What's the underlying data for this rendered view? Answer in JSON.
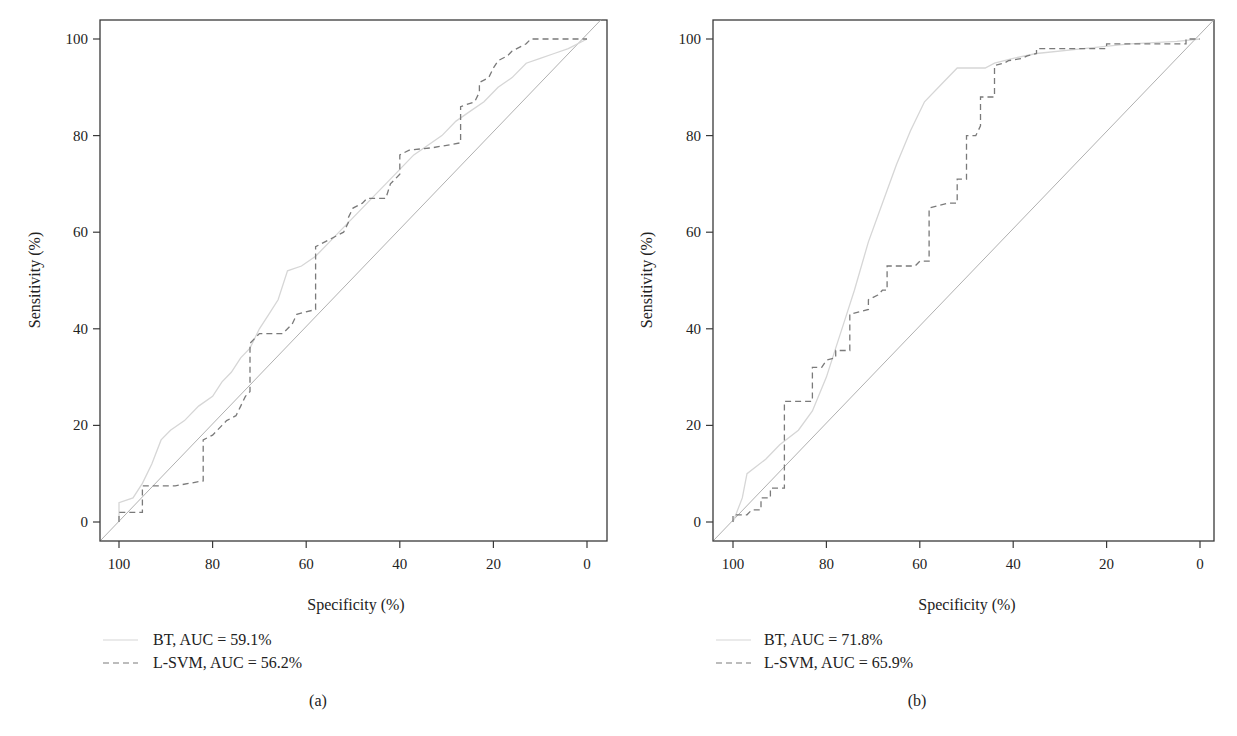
{
  "chart_data": [
    {
      "type": "line",
      "panel_label": "(a)",
      "title": "",
      "xlabel": "Specificity (%)",
      "ylabel": "Sensitivity (%)",
      "xlim": [
        103,
        -3
      ],
      "ylim": [
        -4,
        104
      ],
      "x_reversed": true,
      "xticks": [
        100,
        80,
        60,
        40,
        20,
        0
      ],
      "yticks": [
        0,
        20,
        40,
        60,
        80,
        100
      ],
      "grid": false,
      "legend_position": "below-left",
      "reference_line": {
        "name": "chance diagonal",
        "points": [
          [
            100,
            0
          ],
          [
            0,
            100
          ]
        ],
        "color": "#b0b0b0"
      },
      "series": [
        {
          "name": "BT, AUC = 59.1%",
          "label": "BT",
          "auc": "59.1%",
          "style": "solid",
          "color": "#d6d6d6",
          "points": [
            [
              100,
              0
            ],
            [
              100,
              4
            ],
            [
              97,
              5
            ],
            [
              95,
              8
            ],
            [
              93,
              12
            ],
            [
              91,
              17
            ],
            [
              89,
              19
            ],
            [
              86,
              21
            ],
            [
              83,
              24
            ],
            [
              80,
              26
            ],
            [
              78,
              29
            ],
            [
              76,
              31
            ],
            [
              74,
              34
            ],
            [
              72,
              36
            ],
            [
              70,
              40
            ],
            [
              68,
              43
            ],
            [
              66,
              46
            ],
            [
              64,
              52
            ],
            [
              61,
              53
            ],
            [
              58,
              55
            ],
            [
              55,
              58
            ],
            [
              52,
              61
            ],
            [
              49,
              64
            ],
            [
              46,
              67
            ],
            [
              43,
              70
            ],
            [
              40,
              73
            ],
            [
              37,
              76
            ],
            [
              34,
              78
            ],
            [
              31,
              80
            ],
            [
              28,
              83
            ],
            [
              25,
              85
            ],
            [
              22,
              87
            ],
            [
              19,
              90
            ],
            [
              16,
              92
            ],
            [
              13,
              95
            ],
            [
              10,
              96
            ],
            [
              7,
              97
            ],
            [
              4,
              98
            ],
            [
              0,
              100
            ]
          ]
        },
        {
          "name": "L-SVM, AUC = 56.2%",
          "label": "L-SVM",
          "auc": "56.2%",
          "style": "dashed",
          "color": "#7a7a7a",
          "points": [
            [
              100,
              0
            ],
            [
              100,
              2
            ],
            [
              95,
              2
            ],
            [
              95,
              7.5
            ],
            [
              88,
              7.5
            ],
            [
              82,
              8.5
            ],
            [
              82,
              17
            ],
            [
              80,
              18
            ],
            [
              78,
              20
            ],
            [
              77,
              21
            ],
            [
              75,
              22
            ],
            [
              74,
              24
            ],
            [
              73,
              26
            ],
            [
              72,
              27
            ],
            [
              72,
              37
            ],
            [
              70,
              39
            ],
            [
              65,
              39
            ],
            [
              63,
              41
            ],
            [
              62,
              43
            ],
            [
              58,
              44
            ],
            [
              58,
              57
            ],
            [
              56,
              58
            ],
            [
              54,
              59
            ],
            [
              52,
              60
            ],
            [
              51,
              62
            ],
            [
              51,
              63
            ],
            [
              50,
              65
            ],
            [
              48,
              66
            ],
            [
              47,
              67
            ],
            [
              43,
              67
            ],
            [
              42,
              70
            ],
            [
              41,
              71
            ],
            [
              40,
              72
            ],
            [
              40,
              76
            ],
            [
              38,
              77
            ],
            [
              33,
              77.5
            ],
            [
              30,
              78
            ],
            [
              27,
              78.5
            ],
            [
              27,
              86
            ],
            [
              24,
              87
            ],
            [
              23,
              89
            ],
            [
              23,
              91
            ],
            [
              21,
              92
            ],
            [
              20,
              94
            ],
            [
              19,
              95.5
            ],
            [
              17,
              96.5
            ],
            [
              16,
              97.5
            ],
            [
              14,
              98.5
            ],
            [
              13,
              99
            ],
            [
              12,
              100
            ],
            [
              0,
              100
            ]
          ]
        }
      ]
    },
    {
      "type": "line",
      "panel_label": "(b)",
      "title": "",
      "xlabel": "Specificity (%)",
      "ylabel": "Sensitivity (%)",
      "xlim": [
        103,
        -3
      ],
      "ylim": [
        -4,
        104
      ],
      "x_reversed": true,
      "xticks": [
        100,
        80,
        60,
        40,
        20,
        0
      ],
      "yticks": [
        0,
        20,
        40,
        60,
        80,
        100
      ],
      "grid": false,
      "legend_position": "below-left",
      "reference_line": {
        "name": "chance diagonal",
        "points": [
          [
            100,
            0
          ],
          [
            0,
            100
          ]
        ],
        "color": "#b0b0b0"
      },
      "series": [
        {
          "name": "BT, AUC = 71.8%",
          "label": "BT",
          "auc": "71.8%",
          "style": "solid",
          "color": "#d6d6d6",
          "points": [
            [
              100,
              0
            ],
            [
              98,
              5
            ],
            [
              97,
              10
            ],
            [
              93,
              13
            ],
            [
              90,
              16
            ],
            [
              86,
              19
            ],
            [
              83,
              23
            ],
            [
              80,
              30
            ],
            [
              78,
              36
            ],
            [
              76,
              42
            ],
            [
              74,
              48
            ],
            [
              71,
              58
            ],
            [
              68,
              66
            ],
            [
              65,
              74
            ],
            [
              62,
              81
            ],
            [
              59,
              87
            ],
            [
              55,
              91
            ],
            [
              52,
              94
            ],
            [
              49,
              94
            ],
            [
              46,
              94
            ],
            [
              44,
              95
            ],
            [
              40,
              96
            ],
            [
              35,
              97
            ],
            [
              25,
              98
            ],
            [
              15,
              99
            ],
            [
              5,
              99.5
            ],
            [
              0,
              100
            ]
          ]
        },
        {
          "name": "L-SVM, AUC = 65.9%",
          "label": "L-SVM",
          "auc": "65.9%",
          "style": "dashed",
          "color": "#7a7a7a",
          "points": [
            [
              100,
              0
            ],
            [
              100,
              1.5
            ],
            [
              97,
              1.5
            ],
            [
              96,
              2.5
            ],
            [
              94,
              2.5
            ],
            [
              94,
              5
            ],
            [
              92,
              5
            ],
            [
              92,
              7
            ],
            [
              89,
              7
            ],
            [
              89,
              25
            ],
            [
              83,
              25
            ],
            [
              83,
              32
            ],
            [
              81,
              32
            ],
            [
              80,
              33.5
            ],
            [
              78,
              34
            ],
            [
              78,
              35.5
            ],
            [
              75,
              35.5
            ],
            [
              75,
              43
            ],
            [
              73,
              43.5
            ],
            [
              71,
              44
            ],
            [
              71,
              46
            ],
            [
              69,
              47
            ],
            [
              68,
              48
            ],
            [
              67,
              48
            ],
            [
              67,
              53
            ],
            [
              61,
              53
            ],
            [
              60,
              54
            ],
            [
              58,
              54
            ],
            [
              58,
              65
            ],
            [
              56,
              65.5
            ],
            [
              54,
              66
            ],
            [
              52,
              66
            ],
            [
              52,
              71
            ],
            [
              50,
              71
            ],
            [
              50,
              80
            ],
            [
              48,
              80
            ],
            [
              47,
              82
            ],
            [
              47,
              88
            ],
            [
              44,
              88
            ],
            [
              44,
              94.5
            ],
            [
              42,
              95
            ],
            [
              41,
              95.5
            ],
            [
              38,
              96
            ],
            [
              37,
              96.5
            ],
            [
              35,
              97
            ],
            [
              35,
              98
            ],
            [
              20,
              98
            ],
            [
              20,
              99
            ],
            [
              3,
              99
            ],
            [
              3,
              100
            ],
            [
              0,
              100
            ]
          ]
        }
      ]
    }
  ],
  "panels": [
    {
      "legend": [
        "BT, AUC = 59.1%",
        "L-SVM, AUC = 56.2%"
      ],
      "label": "(a)"
    },
    {
      "legend": [
        "BT, AUC = 71.8%",
        "L-SVM, AUC = 65.9%"
      ],
      "label": "(b)"
    }
  ],
  "colors": {
    "frame": "#3a3a3a",
    "diagonal": "#b0b0b0",
    "bt": "#d6d6d6",
    "lsvm": "#7a7a7a",
    "text": "#222222"
  }
}
